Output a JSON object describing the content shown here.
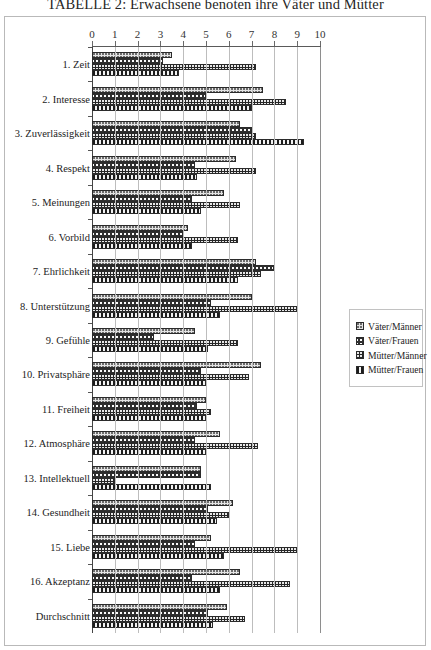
{
  "title": "TABELLE 2: Erwachsene benoten ihre Väter und Mütter",
  "legend": {
    "position": "right",
    "items": [
      {
        "label": "Väter/Männer",
        "swatch": "light-dotted-swatch-icon"
      },
      {
        "label": "Väter/Frauen",
        "swatch": "wavy-line-swatch-icon"
      },
      {
        "label": "Mütter/Männer",
        "swatch": "dark-speckled-swatch-icon"
      },
      {
        "label": "Mütter/Frauen",
        "swatch": "vertical-stripe-swatch-icon"
      }
    ]
  },
  "chart_data": {
    "type": "bar",
    "orientation": "horizontal",
    "title": "TABELLE 2: Erwachsene benoten ihre Väter und Mütter",
    "xlabel": "",
    "ylabel": "",
    "xlim": [
      0,
      10
    ],
    "xticks": [
      0,
      1,
      2,
      3,
      4,
      5,
      6,
      7,
      8,
      9,
      10
    ],
    "grid": true,
    "legend_entries": [
      "Väter/Männer",
      "Väter/Frauen",
      "Mütter/Männer",
      "Mütter/Frauen"
    ],
    "categories": [
      "1. Zeit",
      "2. Interesse",
      "3. Zuverlässigkeit",
      "4. Respekt",
      "5. Meinungen",
      "6. Vorbild",
      "7. Ehrlichkeit",
      "8. Unterstützung",
      "9. Gefühle",
      "10. Privatsphäre",
      "11. Freiheit",
      "12. Atmosphäre",
      "13. Intellektuell",
      "14. Gesundheit",
      "15. Liebe",
      "16. Akzeptanz",
      "Durchschnitt"
    ],
    "series": [
      {
        "name": "Väter/Männer",
        "values": [
          3.5,
          7.5,
          6.5,
          6.3,
          5.8,
          4.2,
          7.2,
          7.0,
          4.5,
          7.4,
          5.0,
          5.6,
          4.8,
          6.2,
          5.2,
          6.5,
          5.9
        ]
      },
      {
        "name": "Väter/Frauen",
        "values": [
          3.1,
          5.0,
          7.0,
          4.5,
          4.4,
          4.0,
          8.0,
          5.2,
          2.7,
          4.8,
          4.6,
          4.5,
          4.8,
          5.1,
          4.5,
          4.4,
          5.1
        ]
      },
      {
        "name": "Mütter/Männer",
        "values": [
          7.2,
          8.5,
          7.2,
          7.2,
          6.5,
          6.4,
          7.4,
          9.0,
          6.4,
          6.9,
          5.2,
          7.3,
          1.0,
          6.0,
          9.0,
          8.7,
          6.7
        ]
      },
      {
        "name": "Mütter/Frauen",
        "values": [
          3.8,
          7.0,
          9.3,
          4.6,
          4.8,
          4.4,
          6.4,
          5.6,
          5.1,
          5.0,
          5.0,
          5.0,
          5.2,
          5.5,
          5.8,
          5.6,
          5.3
        ]
      }
    ]
  }
}
